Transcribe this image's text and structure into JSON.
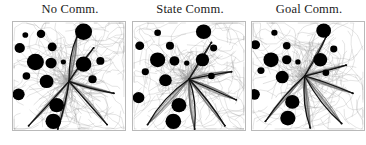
{
  "figure": {
    "background_color": "#ffffff",
    "frame_color": "#b9b9b9",
    "obstacle_color": "#000000",
    "trace_color_light": "#9a9a9a",
    "trace_color_dark": "#111111"
  },
  "panels": [
    {
      "id": "no-comm",
      "title": "No Comm.",
      "left": 12
    },
    {
      "id": "state-comm",
      "title": "State Comm.",
      "left": 132
    },
    {
      "id": "goal-comm",
      "title": "Goal Comm.",
      "left": 251
    }
  ],
  "chart_data": {
    "type": "scatter",
    "title": "",
    "xlabel": "",
    "ylabel": "",
    "xlim": [
      0,
      100
    ],
    "ylim": [
      0,
      100
    ],
    "grid": false,
    "legend": null,
    "panel_count": 3,
    "panel_titles": [
      "No Comm.",
      "State Comm.",
      "Goal Comm."
    ],
    "series": [
      {
        "name": "No Comm.",
        "obstacles": [
          {
            "x": 11,
            "y": 12,
            "r": 2.6
          },
          {
            "x": 25,
            "y": 11,
            "r": 3.8
          },
          {
            "x": 63,
            "y": 9,
            "r": 7.6
          },
          {
            "x": 6,
            "y": 24,
            "r": 4.6
          },
          {
            "x": 35,
            "y": 23,
            "r": 4.0
          },
          {
            "x": 20,
            "y": 37,
            "r": 7.6
          },
          {
            "x": 34,
            "y": 38,
            "r": 5.0
          },
          {
            "x": 45,
            "y": 37,
            "r": 2.3
          },
          {
            "x": 63,
            "y": 39,
            "r": 7.0
          },
          {
            "x": 78,
            "y": 36,
            "r": 3.6
          },
          {
            "x": 12,
            "y": 50,
            "r": 3.4
          },
          {
            "x": 30,
            "y": 55,
            "r": 6.2
          },
          {
            "x": 71,
            "y": 53,
            "r": 3.7
          },
          {
            "x": 5,
            "y": 67,
            "r": 5.4
          },
          {
            "x": 39,
            "y": 77,
            "r": 6.6
          },
          {
            "x": 36,
            "y": 92,
            "r": 7.0
          }
        ],
        "hub": {
          "x": 50,
          "y": 55
        },
        "trace_endpoints": [
          {
            "x": 57,
            "y": 14
          },
          {
            "x": 72,
            "y": 24
          },
          {
            "x": 90,
            "y": 66
          },
          {
            "x": 14,
            "y": 96
          },
          {
            "x": 84,
            "y": 95
          },
          {
            "x": 40,
            "y": 99
          }
        ]
      },
      {
        "name": "State Comm.",
        "obstacles": [
          {
            "x": 22,
            "y": 10,
            "r": 3.0
          },
          {
            "x": 63,
            "y": 9,
            "r": 6.8
          },
          {
            "x": 6,
            "y": 22,
            "r": 4.0
          },
          {
            "x": 33,
            "y": 22,
            "r": 3.6
          },
          {
            "x": 72,
            "y": 24,
            "r": 3.2
          },
          {
            "x": 22,
            "y": 35,
            "r": 6.8
          },
          {
            "x": 37,
            "y": 36,
            "r": 4.4
          },
          {
            "x": 48,
            "y": 38,
            "r": 2.4
          },
          {
            "x": 62,
            "y": 35,
            "r": 6.0
          },
          {
            "x": 11,
            "y": 46,
            "r": 3.2
          },
          {
            "x": 70,
            "y": 50,
            "r": 3.0
          },
          {
            "x": 29,
            "y": 54,
            "r": 5.6
          },
          {
            "x": 5,
            "y": 70,
            "r": 5.2
          },
          {
            "x": 41,
            "y": 77,
            "r": 6.6
          },
          {
            "x": 36,
            "y": 92,
            "r": 7.0
          }
        ],
        "hub": {
          "x": 50,
          "y": 53
        },
        "trace_endpoints": [
          {
            "x": 70,
            "y": 19
          },
          {
            "x": 88,
            "y": 46
          },
          {
            "x": 92,
            "y": 72
          },
          {
            "x": 13,
            "y": 95
          },
          {
            "x": 82,
            "y": 96
          },
          {
            "x": 55,
            "y": 99
          }
        ]
      },
      {
        "name": "Goal Comm.",
        "obstacles": [
          {
            "x": 20,
            "y": 10,
            "r": 2.8
          },
          {
            "x": 64,
            "y": 8,
            "r": 6.6
          },
          {
            "x": 3,
            "y": 21,
            "r": 4.2
          },
          {
            "x": 31,
            "y": 22,
            "r": 3.4
          },
          {
            "x": 73,
            "y": 25,
            "r": 3.2
          },
          {
            "x": 17,
            "y": 35,
            "r": 6.8
          },
          {
            "x": 31,
            "y": 35,
            "r": 4.2
          },
          {
            "x": 41,
            "y": 37,
            "r": 2.4
          },
          {
            "x": 61,
            "y": 35,
            "r": 6.2
          },
          {
            "x": 8,
            "y": 45,
            "r": 3.2
          },
          {
            "x": 66,
            "y": 47,
            "r": 3.0
          },
          {
            "x": 27,
            "y": 51,
            "r": 5.8
          },
          {
            "x": 2,
            "y": 67,
            "r": 5.0
          },
          {
            "x": 36,
            "y": 74,
            "r": 6.4
          },
          {
            "x": 32,
            "y": 89,
            "r": 6.8
          }
        ],
        "hub": {
          "x": 47,
          "y": 50
        },
        "trace_endpoints": [
          {
            "x": 66,
            "y": 14
          },
          {
            "x": 84,
            "y": 40
          },
          {
            "x": 90,
            "y": 66
          },
          {
            "x": 12,
            "y": 92
          },
          {
            "x": 80,
            "y": 94
          },
          {
            "x": 52,
            "y": 98
          }
        ]
      }
    ]
  }
}
